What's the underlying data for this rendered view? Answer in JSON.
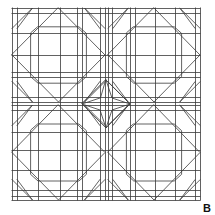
{
  "figure": {
    "label": "B",
    "label_position": {
      "x": 203,
      "y": 203
    },
    "label_font_size": 11,
    "stroke_color": "#3a3a3a",
    "stroke_width": 0.8,
    "background": "#ffffff",
    "bounds": {
      "x0": 12,
      "y0": 8,
      "x1": 200,
      "y1": 200
    }
  },
  "grid": {
    "vertical_lines_x": [
      12,
      17,
      38,
      60,
      77,
      82,
      100,
      105,
      108,
      112,
      130,
      135,
      155,
      175,
      195,
      200
    ],
    "horizontal_lines_y": [
      8,
      13,
      33,
      55,
      72,
      77,
      97,
      102,
      105,
      110,
      132,
      150,
      170,
      190,
      196,
      200
    ]
  },
  "quadrants": [
    {
      "name": "top-left",
      "x0": 12,
      "y0": 8,
      "x1": 105,
      "y1": 102
    },
    {
      "name": "top-right",
      "x0": 108,
      "y0": 8,
      "x1": 200,
      "y1": 102
    },
    {
      "name": "bottom-left",
      "x0": 12,
      "y0": 105,
      "x1": 105,
      "y1": 200
    },
    {
      "name": "bottom-right",
      "x0": 108,
      "y0": 105,
      "x1": 200,
      "y1": 200
    }
  ],
  "center_star": {
    "cx": 106,
    "cy": 104,
    "rx": 24,
    "ry": 24,
    "waist": 6
  }
}
